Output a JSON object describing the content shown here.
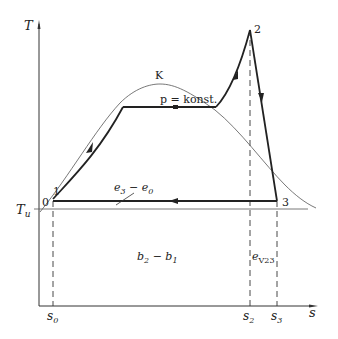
{
  "diagram": {
    "type": "T-s diagram (thermodynamic cycle)",
    "axes": {
      "y_label": "T",
      "x_label": "s",
      "ambient_temperature_label": "T",
      "ambient_temperature_sub": "u"
    },
    "points": [
      {
        "id": "0",
        "label": "0"
      },
      {
        "id": "1",
        "label": "1"
      },
      {
        "id": "2",
        "label": "2"
      },
      {
        "id": "3",
        "label": "3"
      },
      {
        "id": "K",
        "label": "K"
      }
    ],
    "annotations": {
      "isobar": "p = konst.",
      "exergy_loss_label": "e",
      "exergy_loss_sub_a": "3",
      "exergy_loss_mid": " − e",
      "exergy_loss_sub_b": "0",
      "anergy_label": "b",
      "anergy_sub_a": "2",
      "anergy_mid": " − b",
      "anergy_sub_b": "1",
      "ev_label": "e",
      "ev_sub": "V23"
    },
    "x_ticks": [
      {
        "label": "s",
        "sub": "0"
      },
      {
        "label": "s",
        "sub": "2"
      },
      {
        "label": "s",
        "sub": "3"
      }
    ],
    "colors": {
      "line": "#222222",
      "thin": "#555555",
      "background": "#ffffff"
    }
  }
}
